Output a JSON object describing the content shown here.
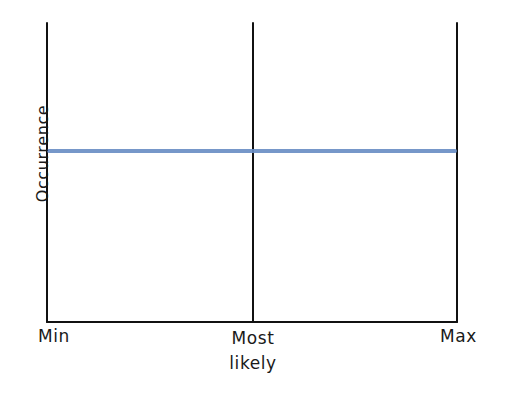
{
  "chart_data": {
    "type": "line",
    "title": "",
    "subtitle": "",
    "xlabel": "",
    "ylabel": "Occurrence",
    "grid": false,
    "legend": null,
    "style": "hand-drawn sketch",
    "categories": [
      "Min",
      "Most likely",
      "Max"
    ],
    "tick_labels": {
      "min": "Min",
      "mid_line1": "Most",
      "mid_line2": "likely",
      "max": "Max"
    },
    "axis_ranges": {
      "x": [
        "Min",
        "Max"
      ],
      "y": [
        0,
        1
      ]
    },
    "series": [
      {
        "name": "uniform-distribution",
        "color": "#6a8ec4",
        "x": [
          "Min",
          "Most likely",
          "Max"
        ],
        "values": [
          0.57,
          0.57,
          0.57
        ],
        "description": "flat horizontal line spanning Min to Max at constant occurrence"
      }
    ],
    "annotations": [
      {
        "name": "most-likely-divider",
        "type": "vertical-line",
        "x": "Most likely",
        "color": "#111111"
      },
      {
        "name": "max-boundary",
        "type": "vertical-line",
        "x": "Max",
        "color": "#111111"
      }
    ],
    "colors": {
      "series": "#6a8ec4",
      "axis": "#111111",
      "background": "#ffffff"
    }
  }
}
